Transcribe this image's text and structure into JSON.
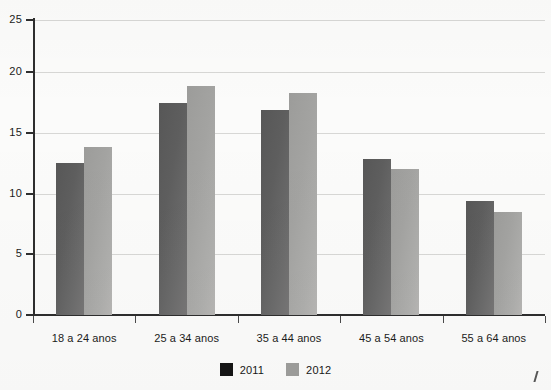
{
  "chart_data": {
    "type": "bar",
    "title": "",
    "subtitle": "",
    "xlabel": "",
    "ylabel": "",
    "categories": [
      "18 a 24 anos",
      "25 a 34 anos",
      "35 a 44 anos",
      "45 a 54 anos",
      "55 a 64 anos"
    ],
    "series": [
      {
        "name": "2011",
        "color": "#606060",
        "values": [
          12.9,
          18.0,
          17.4,
          13.2,
          9.7
        ]
      },
      {
        "name": "2012",
        "color": "#a5a5a3",
        "values": [
          14.2,
          19.4,
          18.8,
          12.4,
          8.7
        ]
      }
    ],
    "ylim": [
      0,
      25
    ],
    "yticks": [
      0,
      5,
      10,
      15,
      20,
      25
    ],
    "ytick_labels": [
      "0",
      "5",
      "10",
      "15",
      "20",
      "25"
    ],
    "grid": true,
    "grid_axis": "y",
    "legend_position": "bottom-center",
    "legend_entries": [
      "2011",
      "2012"
    ]
  },
  "axis": {
    "y_labels": [
      "25",
      "20",
      "15",
      "10",
      "5",
      "0"
    ]
  },
  "legend": {
    "items": [
      {
        "label": "2011"
      },
      {
        "label": "2012"
      }
    ]
  }
}
